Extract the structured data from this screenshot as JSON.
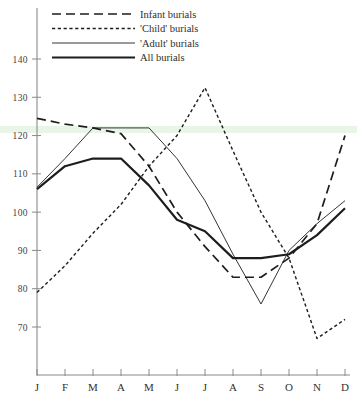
{
  "chart_data": {
    "type": "line",
    "title": "",
    "xlabel": "",
    "ylabel": "",
    "categories": [
      "J",
      "F",
      "M",
      "A",
      "M",
      "J",
      "J",
      "A",
      "S",
      "O",
      "N",
      "D"
    ],
    "x_tick_labels": [
      "J",
      "F",
      "M",
      "A",
      "M",
      "J",
      "J",
      "A",
      "S",
      "O",
      "N",
      "D"
    ],
    "y_tick_labels": [
      "140",
      "130",
      "120",
      "110",
      "100",
      "90",
      "80",
      "70"
    ],
    "y_tick_values": [
      140,
      130,
      120,
      110,
      100,
      90,
      80,
      70
    ],
    "ylim": [
      63,
      145
    ],
    "xlim": [
      0,
      11
    ],
    "grid": false,
    "legend_position": "top-left",
    "series": [
      {
        "name": "Infant burials",
        "style": "long-dash",
        "values": [
          124.5,
          123,
          122,
          120.5,
          112,
          100,
          91,
          83,
          83,
          88,
          97,
          120
        ]
      },
      {
        "name": "'Child' burials",
        "style": "dotted",
        "values": [
          79,
          86,
          94.5,
          102,
          112,
          120,
          132.5,
          116,
          100,
          88,
          67,
          72
        ]
      },
      {
        "name": "'Adult' burials",
        "style": "thin-solid",
        "values": [
          106.5,
          114,
          122,
          122,
          122,
          114,
          103,
          89,
          76,
          90,
          97,
          103
        ]
      },
      {
        "name": "All burials",
        "style": "thick-solid",
        "values": [
          106,
          112,
          114,
          114,
          107,
          98,
          95,
          88,
          88,
          89,
          94,
          101
        ]
      }
    ],
    "legend_entries": [
      {
        "label": "Infant burials",
        "style": "long-dash"
      },
      {
        "label": "'Child' burials",
        "style": "dotted"
      },
      {
        "label": "'Adult' burials",
        "style": "thin-solid"
      },
      {
        "label": "All burials",
        "style": "thick-solid"
      }
    ]
  }
}
